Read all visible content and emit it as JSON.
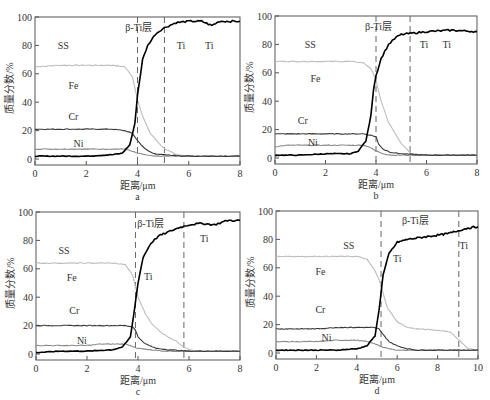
{
  "figure": {
    "ylabel": "质量分数/%",
    "xlabel": "距离/μm"
  },
  "chart_data": [
    {
      "type": "line",
      "panel": "a",
      "caption": "a",
      "xlabel": "距离/μm",
      "ylabel": "质量分数/%",
      "xlim": [
        0,
        8
      ],
      "ylim": [
        0,
        100
      ],
      "xticks": [
        0,
        2,
        4,
        6,
        8
      ],
      "yticks": [
        0,
        20,
        40,
        60,
        80,
        100
      ],
      "grid": false,
      "box": {
        "left": 35,
        "top": 17,
        "right": 240,
        "bottom": 159
      },
      "dashed_lines_x": [
        4.0,
        5.05
      ],
      "annotations": [
        {
          "text": "SS",
          "x": 1.1,
          "y": 80
        },
        {
          "text": "β-Ti层",
          "x": 4.05,
          "y": 93
        },
        {
          "text": "Ti",
          "x": 5.7,
          "y": 80
        },
        {
          "text": "Ti",
          "x": 6.8,
          "y": 80
        },
        {
          "text": "Fe",
          "x": 1.5,
          "y": 52
        },
        {
          "text": "Cr",
          "x": 1.5,
          "y": 30
        },
        {
          "text": "Ni",
          "x": 1.7,
          "y": 11
        }
      ],
      "series": [
        {
          "name": "Fe",
          "color": "#bdbdbd",
          "x": [
            0,
            1,
            2,
            3,
            3.5,
            3.8,
            4.0,
            4.2,
            4.5,
            5.0,
            5.5,
            6,
            7,
            8
          ],
          "y": [
            65,
            66,
            66,
            66,
            65,
            58,
            42,
            30,
            18,
            8,
            3,
            2,
            2,
            2
          ]
        },
        {
          "name": "Cr",
          "color": "#3a3a3a",
          "x": [
            0,
            1,
            2,
            3,
            3.5,
            3.8,
            4.0,
            4.3,
            4.6,
            5,
            6,
            7,
            8
          ],
          "y": [
            21,
            21,
            21,
            21,
            20,
            18,
            13,
            7,
            4,
            3,
            2,
            2,
            2
          ]
        },
        {
          "name": "Ni",
          "color": "#8a8a8a",
          "x": [
            0,
            1,
            2,
            3,
            3.5,
            3.7,
            4.0,
            4.3,
            4.6,
            5,
            6,
            8
          ],
          "y": [
            7,
            7,
            7,
            7,
            7,
            6,
            4,
            3,
            2,
            2,
            2,
            2
          ]
        },
        {
          "name": "Ti",
          "color": "#000000",
          "x": [
            0,
            1,
            2,
            3,
            3.4,
            3.7,
            3.9,
            4.0,
            4.2,
            4.4,
            4.7,
            5.0,
            5.5,
            6,
            6.5,
            6.9,
            7.2,
            8
          ],
          "y": [
            2,
            2,
            2,
            3,
            4,
            10,
            25,
            45,
            70,
            80,
            88,
            92,
            96,
            97,
            97,
            94,
            97,
            97
          ]
        }
      ]
    },
    {
      "type": "line",
      "panel": "b",
      "caption": "b",
      "xlabel": "距离/μm",
      "ylabel": "质量分数/%",
      "xlim": [
        0,
        8
      ],
      "ylim": [
        0,
        100
      ],
      "xticks": [
        0,
        2,
        4,
        6,
        8
      ],
      "yticks": [
        0,
        20,
        40,
        60,
        80,
        100
      ],
      "grid": false,
      "box": {
        "left": 275,
        "top": 16,
        "right": 477,
        "bottom": 158
      },
      "dashed_lines_x": [
        4.0,
        5.35
      ],
      "annotations": [
        {
          "text": "SS",
          "x": 1.4,
          "y": 80
        },
        {
          "text": "β-Ti层",
          "x": 4.1,
          "y": 93
        },
        {
          "text": "Ti",
          "x": 5.9,
          "y": 80
        },
        {
          "text": "Ti",
          "x": 6.8,
          "y": 80
        },
        {
          "text": "Fe",
          "x": 1.6,
          "y": 56
        },
        {
          "text": "Cr",
          "x": 1.1,
          "y": 27
        },
        {
          "text": "Ni",
          "x": 1.5,
          "y": 11
        }
      ],
      "series": [
        {
          "name": "Fe",
          "color": "#bdbdbd",
          "x": [
            0,
            1,
            2,
            3,
            3.5,
            3.8,
            4.0,
            4.2,
            4.5,
            5.0,
            5.4,
            6,
            7,
            8
          ],
          "y": [
            68,
            68,
            68,
            68,
            67,
            63,
            55,
            40,
            25,
            10,
            3,
            2,
            2,
            2
          ]
        },
        {
          "name": "Cr",
          "color": "#3a3a3a",
          "x": [
            0,
            1,
            2,
            3,
            3.5,
            3.8,
            4.0,
            4.1,
            4.3,
            4.6,
            5,
            6,
            8
          ],
          "y": [
            17,
            17,
            17,
            17,
            17,
            16,
            15,
            10,
            6,
            4,
            3,
            2,
            2
          ]
        },
        {
          "name": "Ni",
          "color": "#8a8a8a",
          "x": [
            0,
            0.5,
            1,
            2,
            3,
            3.5,
            3.7,
            4.0,
            4.3,
            4.6,
            5,
            6,
            8
          ],
          "y": [
            8,
            9,
            9,
            9,
            9,
            9,
            8,
            5,
            3,
            2,
            2,
            2,
            2
          ]
        },
        {
          "name": "Ti",
          "color": "#000000",
          "x": [
            0,
            1,
            2,
            3,
            3.3,
            3.6,
            3.8,
            3.9,
            4.0,
            4.2,
            4.5,
            4.8,
            5.0,
            5.5,
            6,
            7,
            8
          ],
          "y": [
            2,
            2,
            3,
            3,
            5,
            12,
            30,
            48,
            58,
            70,
            80,
            85,
            87,
            88,
            89,
            90,
            89
          ]
        }
      ]
    },
    {
      "type": "line",
      "panel": "c",
      "caption": "c",
      "xlabel": "距离/μm",
      "ylabel": "质量分数/%",
      "xlim": [
        0,
        8
      ],
      "ylim": [
        0,
        100
      ],
      "xticks": [
        0,
        2,
        4,
        6,
        8
      ],
      "yticks": [
        0,
        20,
        40,
        60,
        80,
        100
      ],
      "grid": false,
      "box": {
        "left": 36,
        "top": 212,
        "right": 240,
        "bottom": 354
      },
      "dashed_lines_x": [
        3.9,
        5.8
      ],
      "annotations": [
        {
          "text": "SS",
          "x": 1.1,
          "y": 73
        },
        {
          "text": "β-Ti层",
          "x": 4.5,
          "y": 92
        },
        {
          "text": "Ti",
          "x": 6.6,
          "y": 82
        },
        {
          "text": "Fe",
          "x": 1.4,
          "y": 54
        },
        {
          "text": "Ti",
          "x": 4.4,
          "y": 55
        },
        {
          "text": "Cr",
          "x": 1.5,
          "y": 31
        },
        {
          "text": "Ni",
          "x": 1.8,
          "y": 10
        }
      ],
      "series": [
        {
          "name": "Fe",
          "color": "#bdbdbd",
          "x": [
            0,
            1,
            2,
            3,
            3.5,
            3.8,
            4.0,
            4.3,
            4.6,
            5.0,
            5.5,
            5.8,
            6.2,
            7,
            8
          ],
          "y": [
            64,
            64,
            64,
            64,
            63,
            55,
            40,
            28,
            20,
            14,
            9,
            5,
            2,
            2,
            2
          ]
        },
        {
          "name": "Cr",
          "color": "#3a3a3a",
          "x": [
            0,
            1,
            2,
            3,
            3.5,
            3.8,
            3.9,
            4.0,
            4.3,
            4.7,
            5.2,
            6,
            8
          ],
          "y": [
            20,
            20,
            20,
            20,
            20,
            19,
            17,
            12,
            7,
            4,
            3,
            2,
            2
          ]
        },
        {
          "name": "Ni",
          "color": "#8a8a8a",
          "x": [
            0,
            1,
            2,
            2.5,
            3,
            3.5,
            3.7,
            4.0,
            4.4,
            5,
            6,
            8
          ],
          "y": [
            6,
            6,
            6,
            7,
            7,
            7,
            6,
            4,
            3,
            2,
            2,
            2
          ]
        },
        {
          "name": "Ti",
          "color": "#000000",
          "x": [
            0,
            1,
            2,
            3,
            3.4,
            3.7,
            3.85,
            4.0,
            4.2,
            4.5,
            4.8,
            5.2,
            5.6,
            6,
            6.5,
            7,
            7.5,
            8
          ],
          "y": [
            1,
            2,
            2,
            3,
            5,
            12,
            30,
            50,
            68,
            78,
            83,
            86,
            89,
            91,
            92,
            91,
            94,
            94
          ]
        }
      ]
    },
    {
      "type": "line",
      "panel": "d",
      "caption": "d",
      "xlabel": "距离/μm",
      "ylabel": "质量分数/%",
      "xlim": [
        0,
        10
      ],
      "ylim": [
        0,
        100
      ],
      "xticks": [
        0,
        2,
        4,
        6,
        8,
        10
      ],
      "yticks": [
        0,
        20,
        40,
        60,
        80,
        100
      ],
      "grid": false,
      "box": {
        "left": 276,
        "top": 211,
        "right": 478,
        "bottom": 353
      },
      "dashed_lines_x": [
        5.2,
        9.05
      ],
      "annotations": [
        {
          "text": "SS",
          "x": 3.6,
          "y": 76
        },
        {
          "text": "β-Ti层",
          "x": 6.9,
          "y": 94
        },
        {
          "text": "Ti",
          "x": 9.3,
          "y": 76
        },
        {
          "text": "Fe",
          "x": 2.2,
          "y": 58
        },
        {
          "text": "Ti",
          "x": 6.0,
          "y": 67
        },
        {
          "text": "Cr",
          "x": 2.2,
          "y": 31
        },
        {
          "text": "Ni",
          "x": 2.5,
          "y": 11
        }
      ],
      "series": [
        {
          "name": "Fe",
          "color": "#bdbdbd",
          "x": [
            0,
            1,
            2,
            3,
            4,
            4.5,
            4.9,
            5.2,
            5.5,
            6,
            6.5,
            7,
            8,
            8.6,
            9,
            9.5,
            10
          ],
          "y": [
            68,
            68,
            68,
            68,
            68,
            66,
            58,
            48,
            32,
            22,
            18,
            17,
            16,
            15,
            10,
            3,
            2
          ]
        },
        {
          "name": "Cr",
          "color": "#3a3a3a",
          "x": [
            0,
            1,
            2,
            3,
            4,
            4.8,
            5.1,
            5.3,
            5.6,
            6,
            6.5,
            7,
            8,
            10
          ],
          "y": [
            17,
            17,
            17,
            18,
            18,
            18,
            17,
            13,
            8,
            5,
            3,
            2,
            2,
            2
          ]
        },
        {
          "name": "Ni",
          "color": "#8a8a8a",
          "x": [
            0,
            1,
            2,
            3,
            4,
            4.5,
            5.0,
            5.3,
            5.6,
            6,
            7,
            10
          ],
          "y": [
            8,
            8,
            8,
            9,
            9,
            8,
            6,
            4,
            3,
            2,
            2,
            2
          ]
        },
        {
          "name": "Ti",
          "color": "#000000",
          "x": [
            0,
            1,
            2,
            3,
            4,
            4.5,
            4.9,
            5.1,
            5.3,
            5.6,
            6.0,
            6.5,
            7,
            7.5,
            8,
            8.5,
            9,
            9.5,
            10
          ],
          "y": [
            2,
            2,
            2,
            2,
            3,
            5,
            12,
            30,
            55,
            70,
            78,
            80,
            81,
            82,
            83,
            84,
            86,
            88,
            89
          ]
        }
      ]
    }
  ]
}
